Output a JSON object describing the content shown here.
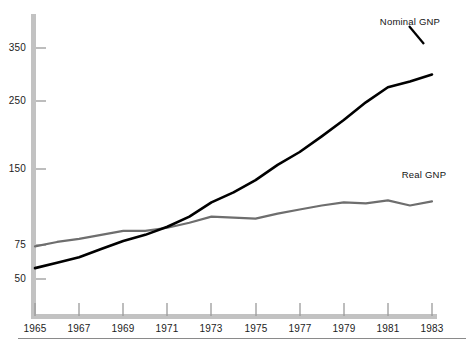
{
  "chart_data": {
    "type": "line",
    "title": "",
    "subtitle": "",
    "xlabel": "",
    "ylabel": "",
    "grid": false,
    "legend_position": "inline-annotation",
    "x": [
      1965,
      1966,
      1967,
      1968,
      1969,
      1970,
      1971,
      1972,
      1973,
      1974,
      1975,
      1976,
      1977,
      1978,
      1979,
      1980,
      1981,
      1982,
      1983
    ],
    "x_ticks": [
      "1965",
      "1967",
      "1969",
      "1971",
      "1973",
      "1975",
      "1977",
      "1979",
      "1981",
      "1983"
    ],
    "y_ticks": [
      "50",
      "75",
      "150",
      "250",
      "350"
    ],
    "y_tick_values": [
      50,
      75,
      150,
      250,
      350
    ],
    "xlim": [
      1965,
      1983
    ],
    "ylim": [
      40,
      400
    ],
    "series": [
      {
        "name": "Nominal GNP",
        "color": "#000000",
        "width": 2.6,
        "label_text": "Nominal GNP",
        "values": [
          58,
          62,
          66,
          72,
          79,
          85,
          93,
          103,
          117,
          127,
          139,
          156,
          175,
          198,
          222,
          248,
          276,
          287,
          300
        ]
      },
      {
        "name": "Real GNP",
        "color": "#6e6e6e",
        "width": 2.2,
        "label_text": "Real GNP",
        "values": [
          74,
          78,
          81,
          85,
          89,
          89,
          92,
          97,
          103,
          102,
          101,
          106,
          110,
          114,
          117,
          116,
          119,
          114,
          118
        ]
      }
    ],
    "annotations": [
      {
        "text": "Nominal GNP",
        "target_x": 1983,
        "target_series": "Nominal GNP"
      },
      {
        "text": "Real GNP",
        "target_x": 1983,
        "target_series": "Real GNP"
      }
    ]
  },
  "axes": {
    "axis_color": "#b6b6b6",
    "tick_color": "#9a9a9a",
    "text_color": "#1c1c1c",
    "y_axis_labels": [
      {
        "text": "350",
        "y": 48
      },
      {
        "text": "250",
        "y": 101
      },
      {
        "text": "150",
        "y": 169
      },
      {
        "text": "75",
        "y": 245
      },
      {
        "text": "50",
        "y": 279
      }
    ],
    "x_axis_labels": [
      {
        "text": "1965",
        "x": 35
      },
      {
        "text": "1967",
        "x": 79
      },
      {
        "text": "1969",
        "x": 123
      },
      {
        "text": "1971",
        "x": 167
      },
      {
        "text": "1973",
        "x": 211
      },
      {
        "text": "1975",
        "x": 256
      },
      {
        "text": "1977",
        "x": 300
      },
      {
        "text": "1979",
        "x": 344
      },
      {
        "text": "1981",
        "x": 388
      },
      {
        "text": "1983",
        "x": 432
      }
    ]
  },
  "series_annotations": [
    {
      "text": "Nominal GNP",
      "x": 410,
      "y": 16
    },
    {
      "text": "Real GNP",
      "x": 424,
      "y": 169
    }
  ]
}
